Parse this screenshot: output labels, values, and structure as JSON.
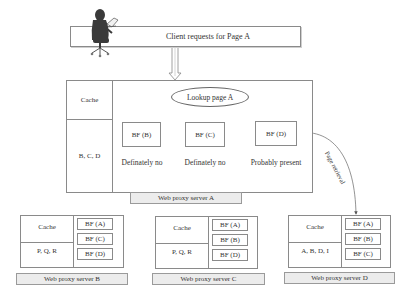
{
  "client_bar": {
    "label": "Client requests for Page A"
  },
  "server_a": {
    "cache_label": "Cache",
    "cache_contents": "B, C, D",
    "lookup_label": "Lookup page A",
    "filters": [
      {
        "label": "BF (B)",
        "result": "Definately no"
      },
      {
        "label": "BF (C)",
        "result": "Definately no"
      },
      {
        "label": "BF (D)",
        "result": "Probably present"
      }
    ],
    "name": "Web proxy server A"
  },
  "page_retrieval_label": "Page retrieval",
  "servers": [
    {
      "name": "Web proxy server B",
      "cache_label": "Cache",
      "cache_contents": "P, Q, R",
      "filters": [
        "BF (A)",
        "BF (C)",
        "BF (D)"
      ]
    },
    {
      "name": "Web proxy server C",
      "cache_label": "Cache",
      "cache_contents": "P, Q, R",
      "filters": [
        "BF (A)",
        "BF (B)",
        "BF (D)"
      ]
    },
    {
      "name": "Web proxy server D",
      "cache_label": "Cache",
      "cache_contents": "A, B, D, I",
      "filters": [
        "BF (A)",
        "BF (B)",
        "BF (C)"
      ]
    }
  ],
  "colors": {
    "line": "#8a8a8a",
    "label_bg": "#ececec",
    "person": "#3a3a3a"
  }
}
